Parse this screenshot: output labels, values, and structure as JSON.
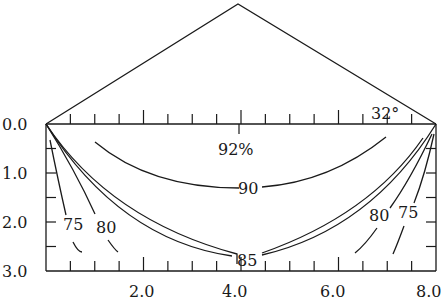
{
  "diagram": {
    "title": "",
    "angle_label": "32°",
    "x_axis": {
      "range": [
        0,
        8
      ],
      "tick_step": 0.5,
      "major_step": 2.0,
      "labels": [
        "2.0",
        "4.0",
        "6.0",
        "8.0"
      ],
      "label_values": [
        2,
        4,
        6,
        8
      ]
    },
    "y_axis": {
      "range": [
        0,
        3
      ],
      "tick_step": 0.5,
      "labels": [
        "0.0",
        "1.0",
        "2.0",
        "3.0"
      ],
      "label_values": [
        0,
        1,
        2,
        3
      ]
    },
    "contours": [
      {
        "label": "92%",
        "value": 92
      },
      {
        "label": "90",
        "value": 90
      },
      {
        "label": "85",
        "value": 85
      },
      {
        "label": "80",
        "value": 80,
        "side": "left"
      },
      {
        "label": "75",
        "value": 75,
        "side": "left"
      },
      {
        "label": "80",
        "value": 80,
        "side": "right"
      },
      {
        "label": "75",
        "value": 75,
        "side": "right"
      }
    ]
  }
}
